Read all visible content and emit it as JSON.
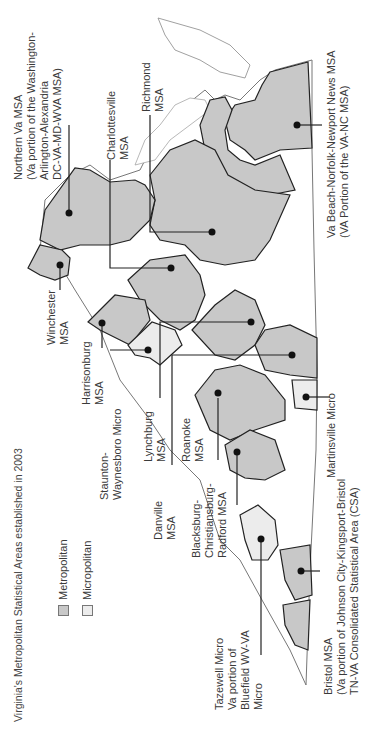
{
  "title": "Virginia's Metropolitan Statistical Areas established in 2003",
  "legend": [
    {
      "label": "Metropolitan",
      "color": "#c8c8c8"
    },
    {
      "label": "Micropolitan",
      "color": "#ececec"
    }
  ],
  "colors": {
    "metropolitan": "#c8c8c8",
    "micropolitan": "#ececec",
    "non_msa": "#ffffff",
    "county_border": "#8a8a8a",
    "msa_border": "#222222",
    "leader_line": "#222222"
  },
  "areas": [
    {
      "id": "northern-va",
      "type": "Metropolitan",
      "label": "Northern Va MSA\n(Va portion of the Washington-\nArlington-Alexandria\nDC-VA-MD-WVA MSA)"
    },
    {
      "id": "charlottesville",
      "type": "Metropolitan",
      "label": "Charlottesville\nMSA"
    },
    {
      "id": "richmond",
      "type": "Metropolitan",
      "label": "Richmond\nMSA"
    },
    {
      "id": "va-beach",
      "type": "Metropolitan",
      "label": "Va Beach-Norfolk-Newport News MSA\n(VA Portion of the VA-NC MSA)"
    },
    {
      "id": "winchester",
      "type": "Metropolitan",
      "label": "Winchester\nMSA"
    },
    {
      "id": "harrisonburg",
      "type": "Metropolitan",
      "label": "Harrisonburg\nMSA"
    },
    {
      "id": "staunton",
      "type": "Micropolitan",
      "label": "Staunton-\nWaynesboro Micro"
    },
    {
      "id": "lynchburg",
      "type": "Metropolitan",
      "label": "Lynchburg\nMSA"
    },
    {
      "id": "danville",
      "type": "Metropolitan",
      "label": "Danville\nMSA"
    },
    {
      "id": "roanoke",
      "type": "Metropolitan",
      "label": "Roanoke\nMSA"
    },
    {
      "id": "blacksburg",
      "type": "Metropolitan",
      "label": "Blacksburg-\nChristiansburg-\nRadford MSA"
    },
    {
      "id": "martinsville",
      "type": "Micropolitan",
      "label": "Martinsville Micro"
    },
    {
      "id": "tazewell",
      "type": "Micropolitan",
      "label": "Tazewell Micro\nVa portion of\nBluefield WV-VA\nMicro"
    },
    {
      "id": "bristol",
      "type": "Metropolitan",
      "label": "Bristol MSA\n(Va portion of Johnson City-Kingsport-Bristol\nTN-VA Consolidated Statistical Area (CSA)"
    }
  ]
}
